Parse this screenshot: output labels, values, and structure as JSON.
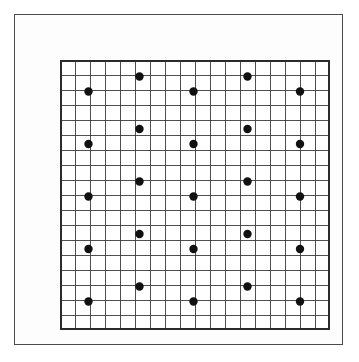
{
  "figure": {
    "title": "",
    "caption": "",
    "background_color": "#ffffff",
    "frame": {
      "name": "outer-frame",
      "x": 14,
      "y": 14,
      "width": 329,
      "height": 331,
      "stroke_color": "#4a4a4a",
      "stroke_width": 1.6
    }
  },
  "chart_data": {
    "type": "scatter",
    "title": "",
    "subtitle": "",
    "xlabel": "",
    "ylabel": "",
    "grid": true,
    "legend": "none",
    "annotations": [],
    "grid_spec": {
      "origin_x": 45,
      "origin_y": 45,
      "cell_size": 15,
      "columns": 18,
      "rows": 18,
      "width": 270,
      "height": 270,
      "line_color": "#3c3c3c",
      "line_width": 0.9,
      "border_color": "#2b2b2b",
      "border_width": 1.8
    },
    "xlim": [
      0,
      18
    ],
    "ylim": [
      0,
      18
    ],
    "xticks": [
      0,
      1,
      2,
      3,
      4,
      5,
      6,
      7,
      8,
      9,
      10,
      11,
      12,
      13,
      14,
      15,
      16,
      17,
      18
    ],
    "yticks": [
      0,
      1,
      2,
      3,
      4,
      5,
      6,
      7,
      8,
      9,
      10,
      11,
      12,
      13,
      14,
      15,
      16,
      17,
      18
    ],
    "xticklabels": [],
    "yticklabels": [],
    "marker": {
      "shape": "circle",
      "color": "#111111",
      "radius_px": 4.2,
      "count": 26
    },
    "series": [
      {
        "name": "lattice-points",
        "color": "#111111",
        "points": [
          {
            "x": 5.3,
            "y": 16.9
          },
          {
            "x": 12.5,
            "y": 16.9
          },
          {
            "x": 1.9,
            "y": 15.9
          },
          {
            "x": 8.9,
            "y": 15.9
          },
          {
            "x": 16.0,
            "y": 15.9
          },
          {
            "x": 5.3,
            "y": 13.4
          },
          {
            "x": 12.5,
            "y": 13.4
          },
          {
            "x": 1.9,
            "y": 12.4
          },
          {
            "x": 8.9,
            "y": 12.4
          },
          {
            "x": 16.0,
            "y": 12.4
          },
          {
            "x": 5.3,
            "y": 9.9
          },
          {
            "x": 12.5,
            "y": 9.9
          },
          {
            "x": 1.9,
            "y": 8.9
          },
          {
            "x": 8.9,
            "y": 8.9
          },
          {
            "x": 16.0,
            "y": 8.9
          },
          {
            "x": 5.3,
            "y": 6.4
          },
          {
            "x": 12.5,
            "y": 6.4
          },
          {
            "x": 1.9,
            "y": 5.4
          },
          {
            "x": 8.9,
            "y": 5.4
          },
          {
            "x": 16.0,
            "y": 5.4
          },
          {
            "x": 5.3,
            "y": 2.9
          },
          {
            "x": 12.5,
            "y": 2.9
          },
          {
            "x": 1.9,
            "y": 1.9
          },
          {
            "x": 8.9,
            "y": 1.9
          },
          {
            "x": 16.0,
            "y": 1.9
          }
        ]
      }
    ]
  }
}
